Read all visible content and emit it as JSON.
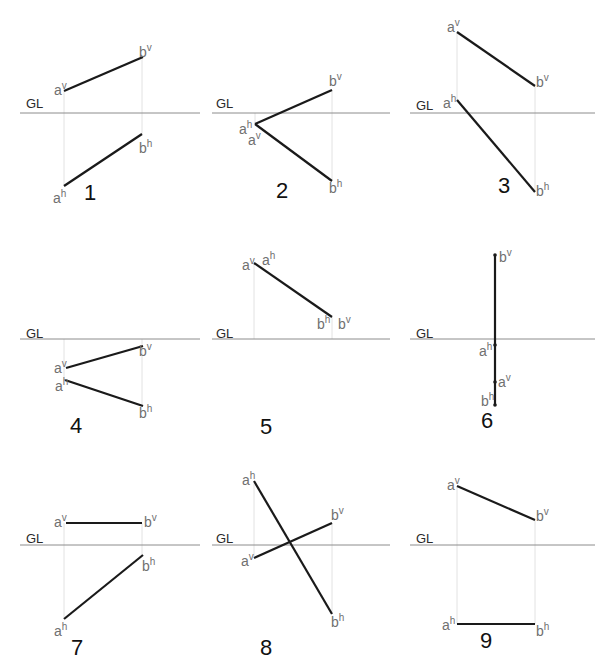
{
  "figure": {
    "ground_line_label": "GL",
    "colors": {
      "segment": "#1a1a1a",
      "ground_line": "#8c8c8c",
      "projector": "#e2e2e2",
      "point_label": "#707070",
      "number": "#111111"
    }
  },
  "panels": [
    {
      "number": "1",
      "gl": {
        "y": 113,
        "x1": 20,
        "x2": 200,
        "label_x": 26,
        "label_y": 108
      },
      "projectors": [
        {
          "x": 64,
          "y1": 91,
          "y2": 186
        },
        {
          "x": 142,
          "y1": 57,
          "y2": 134
        }
      ],
      "segments": [
        {
          "x1": 64,
          "y1": 91,
          "x2": 143,
          "y2": 57
        },
        {
          "x1": 64,
          "y1": 186,
          "x2": 142,
          "y2": 134
        }
      ],
      "labels": [
        {
          "base": "a",
          "sup": "v",
          "x": 54,
          "y": 95
        },
        {
          "base": "b",
          "sup": "v",
          "x": 139,
          "y": 57
        },
        {
          "base": "b",
          "sup": "h",
          "x": 139,
          "y": 153
        },
        {
          "base": "a",
          "sup": "h",
          "x": 53,
          "y": 203
        }
      ],
      "number_pos": {
        "x": 84,
        "y": 200
      }
    },
    {
      "number": "2",
      "gl": {
        "y": 113,
        "x1": 212,
        "x2": 390,
        "label_x": 216,
        "label_y": 108
      },
      "projectors": [
        {
          "x": 255,
          "y1": 113,
          "y2": 124
        },
        {
          "x": 332,
          "y1": 90,
          "y2": 181
        }
      ],
      "segments": [
        {
          "x1": 255,
          "y1": 124,
          "x2": 332,
          "y2": 90
        },
        {
          "x1": 255,
          "y1": 124,
          "x2": 332,
          "y2": 181
        }
      ],
      "labels": [
        {
          "base": "b",
          "sup": "v",
          "x": 329,
          "y": 86
        },
        {
          "base": "a",
          "sup": "h",
          "x": 239,
          "y": 134
        },
        {
          "base": "a",
          "sup": "v",
          "x": 248,
          "y": 145
        },
        {
          "base": "b",
          "sup": "h",
          "x": 329,
          "y": 193
        }
      ],
      "number_pos": {
        "x": 276,
        "y": 198
      }
    },
    {
      "number": "3",
      "gl": {
        "y": 113,
        "x1": 410,
        "x2": 595,
        "label_x": 416,
        "label_y": 110
      },
      "projectors": [
        {
          "x": 457,
          "y1": 32,
          "y2": 100
        },
        {
          "x": 535,
          "y1": 86,
          "y2": 192
        }
      ],
      "segments": [
        {
          "x1": 457,
          "y1": 32,
          "x2": 535,
          "y2": 86
        },
        {
          "x1": 457,
          "y1": 100,
          "x2": 535,
          "y2": 192
        }
      ],
      "labels": [
        {
          "base": "a",
          "sup": "v",
          "x": 447,
          "y": 32
        },
        {
          "base": "b",
          "sup": "v",
          "x": 536,
          "y": 87
        },
        {
          "base": "a",
          "sup": "h",
          "x": 443,
          "y": 108
        },
        {
          "base": "b",
          "sup": "h",
          "x": 536,
          "y": 196
        }
      ],
      "number_pos": {
        "x": 498,
        "y": 193
      }
    },
    {
      "number": "4",
      "gl": {
        "y": 339,
        "x1": 20,
        "x2": 200,
        "label_x": 26,
        "label_y": 338
      },
      "projectors": [
        {
          "x": 64,
          "y1": 339,
          "y2": 380
        },
        {
          "x": 142,
          "y1": 339,
          "y2": 406
        }
      ],
      "segments": [
        {
          "x1": 66,
          "y1": 368,
          "x2": 143,
          "y2": 346
        },
        {
          "x1": 65,
          "y1": 380,
          "x2": 143,
          "y2": 406
        }
      ],
      "labels": [
        {
          "base": "a",
          "sup": "v",
          "x": 54,
          "y": 373
        },
        {
          "base": "b",
          "sup": "v",
          "x": 139,
          "y": 356
        },
        {
          "base": "a",
          "sup": "h",
          "x": 55,
          "y": 391
        },
        {
          "base": "b",
          "sup": "h",
          "x": 139,
          "y": 418
        }
      ],
      "number_pos": {
        "x": 70,
        "y": 433
      }
    },
    {
      "number": "5",
      "gl": {
        "y": 339,
        "x1": 212,
        "x2": 390,
        "label_x": 216,
        "label_y": 338
      },
      "projectors": [
        {
          "x": 254,
          "y1": 263,
          "y2": 339
        },
        {
          "x": 332,
          "y1": 317,
          "y2": 339
        }
      ],
      "segments": [
        {
          "x1": 254,
          "y1": 263,
          "x2": 332,
          "y2": 317
        }
      ],
      "labels": [
        {
          "base": "a",
          "sup": "v",
          "x": 242,
          "y": 270
        },
        {
          "base": "a",
          "sup": "h",
          "x": 262,
          "y": 265
        },
        {
          "base": "b",
          "sup": "h",
          "x": 317,
          "y": 329
        },
        {
          "base": "b",
          "sup": "v",
          "x": 338,
          "y": 329
        }
      ],
      "number_pos": {
        "x": 260,
        "y": 434
      }
    },
    {
      "number": "6",
      "gl": {
        "y": 339,
        "x1": 410,
        "x2": 595,
        "label_x": 416,
        "label_y": 338
      },
      "projectors": [],
      "segments": [
        {
          "x1": 495,
          "y1": 255,
          "x2": 495,
          "y2": 405
        }
      ],
      "dots": [
        {
          "x": 495,
          "y": 255
        },
        {
          "x": 495,
          "y": 345
        },
        {
          "x": 495,
          "y": 382
        },
        {
          "x": 495,
          "y": 405
        }
      ],
      "labels": [
        {
          "base": "b",
          "sup": "v",
          "x": 499,
          "y": 262
        },
        {
          "base": "a",
          "sup": "h",
          "x": 479,
          "y": 356
        },
        {
          "base": "a",
          "sup": "v",
          "x": 498,
          "y": 387
        },
        {
          "base": "b",
          "sup": "h",
          "x": 481,
          "y": 406
        }
      ],
      "number_pos": {
        "x": 481,
        "y": 428
      }
    },
    {
      "number": "7",
      "gl": {
        "y": 545,
        "x1": 20,
        "x2": 200,
        "label_x": 26,
        "label_y": 543
      },
      "projectors": [
        {
          "x": 64,
          "y1": 523,
          "y2": 619
        },
        {
          "x": 142,
          "y1": 523,
          "y2": 555
        }
      ],
      "segments": [
        {
          "x1": 66,
          "y1": 523,
          "x2": 142,
          "y2": 523
        },
        {
          "x1": 64,
          "y1": 619,
          "x2": 143,
          "y2": 555
        }
      ],
      "labels": [
        {
          "base": "a",
          "sup": "v",
          "x": 54,
          "y": 527
        },
        {
          "base": "b",
          "sup": "v",
          "x": 144,
          "y": 527
        },
        {
          "base": "b",
          "sup": "h",
          "x": 142,
          "y": 571
        },
        {
          "base": "a",
          "sup": "h",
          "x": 54,
          "y": 636
        }
      ],
      "number_pos": {
        "x": 71,
        "y": 655
      }
    },
    {
      "number": "8",
      "gl": {
        "y": 545,
        "x1": 212,
        "x2": 390,
        "label_x": 216,
        "label_y": 543
      },
      "projectors": [
        {
          "x": 254,
          "y1": 481,
          "y2": 558
        },
        {
          "x": 332,
          "y1": 523,
          "y2": 614
        }
      ],
      "segments": [
        {
          "x1": 254,
          "y1": 481,
          "x2": 332,
          "y2": 614
        },
        {
          "x1": 254,
          "y1": 558,
          "x2": 332,
          "y2": 523
        }
      ],
      "labels": [
        {
          "base": "a",
          "sup": "h",
          "x": 242,
          "y": 485
        },
        {
          "base": "b",
          "sup": "v",
          "x": 331,
          "y": 520
        },
        {
          "base": "a",
          "sup": "v",
          "x": 241,
          "y": 566
        },
        {
          "base": "b",
          "sup": "h",
          "x": 331,
          "y": 627
        }
      ],
      "number_pos": {
        "x": 260,
        "y": 655
      }
    },
    {
      "number": "9",
      "gl": {
        "y": 545,
        "x1": 410,
        "x2": 595,
        "label_x": 416,
        "label_y": 543
      },
      "projectors": [
        {
          "x": 457,
          "y1": 486,
          "y2": 624
        },
        {
          "x": 535,
          "y1": 520,
          "y2": 624
        }
      ],
      "segments": [
        {
          "x1": 457,
          "y1": 486,
          "x2": 535,
          "y2": 520
        },
        {
          "x1": 457,
          "y1": 624,
          "x2": 535,
          "y2": 624
        }
      ],
      "labels": [
        {
          "base": "a",
          "sup": "v",
          "x": 447,
          "y": 490
        },
        {
          "base": "b",
          "sup": "v",
          "x": 536,
          "y": 521
        },
        {
          "base": "a",
          "sup": "h",
          "x": 442,
          "y": 630
        },
        {
          "base": "b",
          "sup": "h",
          "x": 536,
          "y": 636
        }
      ],
      "number_pos": {
        "x": 480,
        "y": 648
      }
    }
  ]
}
